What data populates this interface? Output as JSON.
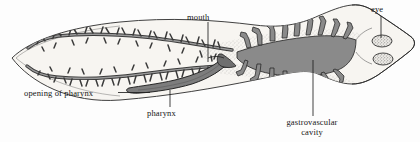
{
  "figure": {
    "background_color": "#fdfdfd",
    "outline_color": "#2b2b2b",
    "cavity_fill_color": "#8a8a8a",
    "pharynx_fill_color": "#7d7d7d",
    "body_fill_color": "#f2f0ec",
    "stipple_color": "#555555"
  },
  "labels": {
    "mouth": "mouth",
    "eye": "eye",
    "opening_of_pharynx": "opening of pharynx",
    "pharynx": "pharynx",
    "gastrovascular_line1": "gastrovascular",
    "gastrovascular_line2": "cavity"
  },
  "parts": [
    {
      "name": "body-outline",
      "description": "elongated leaf-shaped flatworm body, pointed tail left, triangular head with auricles right"
    },
    {
      "name": "gastrovascular-cavity",
      "description": "dark gray branched intestine with many lateral diverticula"
    },
    {
      "name": "pharynx",
      "description": "muscular gray tube extending posteriorly from mouth toward left"
    },
    {
      "name": "mouth",
      "description": "ventral opening at mid-body where pharynx protrudes"
    },
    {
      "name": "opening-of-pharynx",
      "description": "distal tip opening of the pharynx tube"
    },
    {
      "name": "eyespot-upper",
      "description": "stippled oval ocellus on head"
    },
    {
      "name": "eyespot-lower",
      "description": "stippled oval ocellus on head"
    }
  ],
  "leader_lines": [
    {
      "name": "mouth-leader",
      "from": [
        208,
        22
      ],
      "to": [
        208,
        62
      ]
    },
    {
      "name": "eye-leader",
      "from": [
        381,
        16
      ],
      "to": [
        381,
        38
      ]
    },
    {
      "name": "opening-of-pharynx-leader",
      "from": [
        118,
        93
      ],
      "to": [
        150,
        93
      ]
    },
    {
      "name": "pharynx-leader",
      "from": [
        170,
        107
      ],
      "to": [
        170,
        92
      ]
    },
    {
      "name": "gastrovascular-leader",
      "from": [
        313,
        116
      ],
      "to": [
        313,
        60
      ]
    }
  ]
}
